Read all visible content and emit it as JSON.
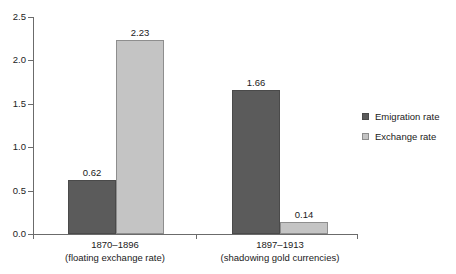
{
  "chart_data": {
    "type": "bar",
    "title": "",
    "xlabel": "",
    "ylabel": "",
    "ylim": [
      0.0,
      2.5
    ],
    "y_ticks": [
      "0.0",
      "0.5",
      "1.0",
      "1.5",
      "2.0",
      "2.5"
    ],
    "grid": false,
    "legend_position": "right",
    "categories": [
      "1870–1896",
      "1897–1913"
    ],
    "category_sublabels": [
      "(floating exchange rate)",
      "(shadowing gold currencies)"
    ],
    "series": [
      {
        "name": "Emigration rate",
        "color": "#5b5b5b",
        "values": [
          0.62,
          1.66
        ],
        "labels": [
          "0.62",
          "1.66"
        ]
      },
      {
        "name": "Exchange rate",
        "color": "#c4c4c4",
        "values": [
          2.23,
          0.14
        ],
        "labels": [
          "2.23",
          "0.14"
        ]
      }
    ]
  },
  "axis": {
    "ticks": [
      {
        "label": "2.5",
        "value": 2.5
      },
      {
        "label": "2.0",
        "value": 2.0
      },
      {
        "label": "1.5",
        "value": 1.5
      },
      {
        "label": "1.0",
        "value": 1.0
      },
      {
        "label": "0.5",
        "value": 0.5
      },
      {
        "label": "0.0",
        "value": 0.0
      }
    ]
  },
  "legend": {
    "items": [
      {
        "label": "Emigration rate",
        "swatch": "series-emigration"
      },
      {
        "label": "Exchange rate",
        "swatch": "series-exchange"
      }
    ]
  }
}
